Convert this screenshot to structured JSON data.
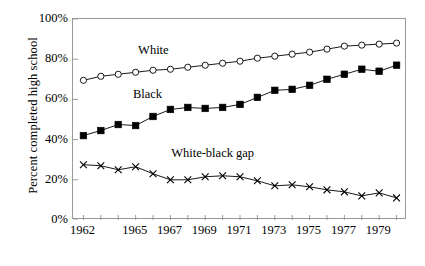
{
  "chart_data": {
    "type": "line",
    "title": "",
    "xlabel": "",
    "ylabel": "Percent completed high school",
    "x": [
      1962,
      1963,
      1964,
      1965,
      1966,
      1967,
      1968,
      1969,
      1970,
      1971,
      1972,
      1973,
      1974,
      1975,
      1976,
      1977,
      1978,
      1979,
      1980
    ],
    "xlim": [
      1961.4,
      1980.6
    ],
    "ylim": [
      0,
      100
    ],
    "yticks": [
      0,
      20,
      40,
      60,
      80,
      100
    ],
    "ytick_labels": [
      "0%",
      "20%",
      "40%",
      "60%",
      "80%",
      "100%"
    ],
    "xtick_labels": [
      "1962",
      "1965",
      "1967",
      "1969",
      "1971",
      "1973",
      "1975",
      "1977",
      "1979"
    ],
    "xtick_values": [
      1962,
      1965,
      1967,
      1969,
      1971,
      1973,
      1975,
      1977,
      1979
    ],
    "grid": false,
    "legend_position": "inline-annotations",
    "series": [
      {
        "name": "White",
        "marker": "open-circle",
        "color": "#000000",
        "values": [
          69.5,
          71.5,
          72.5,
          73.5,
          74.5,
          75.0,
          76.0,
          77.0,
          78.0,
          79.0,
          80.5,
          81.5,
          82.5,
          83.5,
          85.0,
          86.5,
          87.0,
          87.5,
          88.0
        ],
        "annotation": "White",
        "annotation_x": 1965.2,
        "annotation_y": 84.0
      },
      {
        "name": "Black",
        "marker": "filled-square",
        "color": "#000000",
        "values": [
          42.0,
          44.5,
          47.5,
          47.0,
          51.5,
          55.0,
          56.0,
          55.5,
          56.0,
          57.5,
          61.0,
          64.5,
          65.0,
          67.0,
          70.0,
          72.5,
          75.0,
          74.0,
          77.0
        ],
        "annotation": "Black",
        "annotation_x": 1964.9,
        "annotation_y": 62.0
      },
      {
        "name": "White-black gap",
        "marker": "cross",
        "color": "#000000",
        "values": [
          27.5,
          27.0,
          25.0,
          26.5,
          23.0,
          20.0,
          20.0,
          21.5,
          22.0,
          21.5,
          19.5,
          17.0,
          17.5,
          16.5,
          15.0,
          14.0,
          12.0,
          13.5,
          11.0
        ],
        "annotation": "White-black gap",
        "annotation_x": 1967.1,
        "annotation_y": 33.0
      }
    ]
  }
}
